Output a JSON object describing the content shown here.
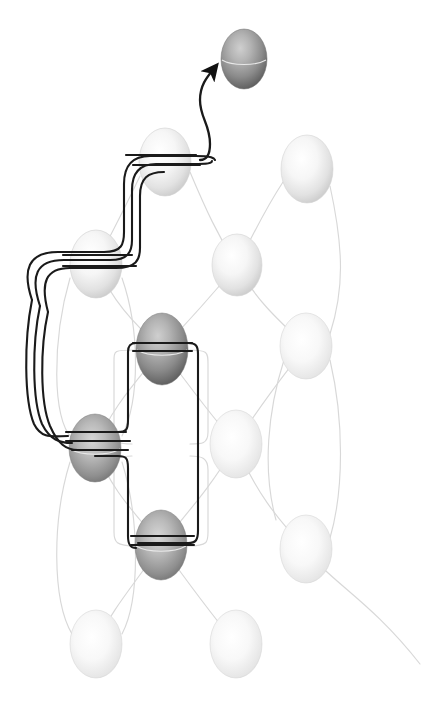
{
  "figure": {
    "title": "Lattice network of spheres with highlighted traversal path",
    "width": 435,
    "height": 704,
    "background_color": "#ffffff",
    "colors": {
      "highlight_path": "#1a1a1a",
      "lattice_edge": "#d8d8d8",
      "lattice_edge_faint": "#e6e6e6",
      "sphere_light_base": "#f2f2f2",
      "sphere_light_shade": "#c9c9c9",
      "sphere_dark_base": "#b0b0b0",
      "sphere_dark_shade": "#4a4a4a",
      "arrow_color": "#111111"
    }
  },
  "chart_data": {
    "type": "scatter",
    "title": "Lattice network of spheres with highlighted traversal path",
    "xlabel": "",
    "ylabel": "",
    "xlim": [
      0,
      435
    ],
    "ylim": [
      0,
      704
    ],
    "grid": false,
    "legend": "none",
    "nodes": [
      {
        "id": "target",
        "label": "target-sphere",
        "shade": "dark",
        "cx": 244,
        "cy": 59,
        "rx": 23,
        "ry": 30,
        "column": "detached",
        "row": 0
      },
      {
        "id": "n-c2-r1",
        "label": "sphere-c2-r1",
        "shade": "light",
        "cx": 165,
        "cy": 162,
        "rx": 26,
        "ry": 34,
        "column": 2,
        "row": 1
      },
      {
        "id": "n-c3-r1",
        "label": "sphere-c3-r1",
        "shade": "light",
        "cx": 307,
        "cy": 169,
        "rx": 26,
        "ry": 34,
        "column": 3,
        "row": 1
      },
      {
        "id": "n-c1-r2",
        "label": "sphere-c1-r2",
        "shade": "light",
        "cx": 96,
        "cy": 264,
        "rx": 26,
        "ry": 34,
        "column": 1,
        "row": 2
      },
      {
        "id": "n-c2-r2",
        "label": "sphere-c2-r2",
        "shade": "light",
        "cx": 237,
        "cy": 265,
        "rx": 25,
        "ry": 31,
        "column": 2,
        "row": 2
      },
      {
        "id": "n-c2-r3",
        "label": "sphere-c2-r3",
        "shade": "dark",
        "cx": 162,
        "cy": 349,
        "rx": 26,
        "ry": 36,
        "column": 2,
        "row": 3
      },
      {
        "id": "n-c3-r3",
        "label": "sphere-c3-r3",
        "shade": "light",
        "cx": 306,
        "cy": 346,
        "rx": 26,
        "ry": 33,
        "column": 3,
        "row": 3
      },
      {
        "id": "n-c1-r4",
        "label": "sphere-c1-r4",
        "shade": "dark",
        "cx": 95,
        "cy": 448,
        "rx": 26,
        "ry": 34,
        "column": 1,
        "row": 4
      },
      {
        "id": "n-c2-r4",
        "label": "sphere-c2-r4",
        "shade": "light",
        "cx": 236,
        "cy": 444,
        "rx": 26,
        "ry": 34,
        "column": 2,
        "row": 4
      },
      {
        "id": "n-c2-r5",
        "label": "sphere-c2-r5",
        "shade": "dark",
        "cx": 161,
        "cy": 545,
        "rx": 26,
        "ry": 35,
        "column": 2,
        "row": 5
      },
      {
        "id": "n-c3-r5",
        "label": "sphere-c3-r5",
        "shade": "light",
        "cx": 306,
        "cy": 549,
        "rx": 26,
        "ry": 34,
        "column": 3,
        "row": 5
      },
      {
        "id": "n-c1-r6",
        "label": "sphere-c1-r6",
        "shade": "light",
        "cx": 96,
        "cy": 644,
        "rx": 26,
        "ry": 34,
        "column": 1,
        "row": 6
      },
      {
        "id": "n-c2-r6",
        "label": "sphere-c2-r6",
        "shade": "light",
        "cx": 236,
        "cy": 644,
        "rx": 26,
        "ry": 34,
        "column": 2,
        "row": 6
      }
    ],
    "highlight_edges": [
      {
        "name": "path-upper-a",
        "from": "n-c1-r2",
        "to": "n-c2-r1"
      },
      {
        "name": "path-upper-b",
        "from": "n-c1-r2",
        "to": "n-c2-r1"
      },
      {
        "name": "path-left-loop-a",
        "from": "n-c1-r2",
        "to": "n-c1-r4"
      },
      {
        "name": "path-left-loop-b",
        "from": "n-c1-r2",
        "to": "n-c1-r4"
      },
      {
        "name": "path-right-loop",
        "from": "n-c2-r3",
        "to": "n-c2-r5"
      },
      {
        "name": "path-branch-to-c1r4",
        "from": "n-c1-r4",
        "to": "n-c2-r3"
      },
      {
        "name": "path-branch-to-c2r5",
        "from": "n-c1-r4",
        "to": "n-c2-r5"
      },
      {
        "name": "path-exit-arrow",
        "from": "n-c2-r1",
        "to": "target"
      }
    ],
    "lattice_edge_count": 24,
    "node_count": 13,
    "dark_node_count": 4,
    "light_node_count": 9
  },
  "annotations": {
    "arrow": {
      "name": "output-arrow",
      "from_x": 200,
      "from_y": 160,
      "to_x": 218,
      "to_y": 62
    }
  }
}
